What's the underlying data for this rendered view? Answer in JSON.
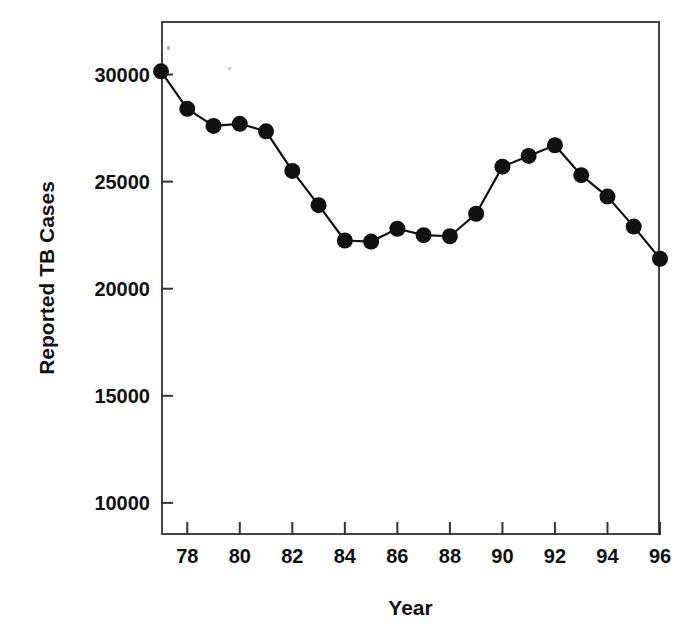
{
  "chart_data": {
    "type": "line",
    "title": "",
    "xlabel": "Year",
    "ylabel": "Reported TB Cases",
    "xlim": [
      77,
      96
    ],
    "ylim": [
      8500,
      32500
    ],
    "grid": false,
    "legend": "none",
    "marker": "filled-circle",
    "line_color": "#111111",
    "marker_color": "#111111",
    "x": [
      77,
      78,
      79,
      80,
      81,
      82,
      83,
      84,
      85,
      86,
      87,
      88,
      89,
      90,
      91,
      92,
      93,
      94,
      95,
      96
    ],
    "xtick_labels": [
      "78",
      "80",
      "82",
      "84",
      "86",
      "88",
      "90",
      "92",
      "94",
      "96"
    ],
    "xticks": [
      78,
      80,
      82,
      84,
      86,
      88,
      90,
      92,
      94,
      96
    ],
    "yticks": [
      10000,
      15000,
      20000,
      25000,
      30000
    ],
    "ytick_labels": [
      "10000",
      "15000",
      "20000",
      "25000",
      "30000"
    ],
    "values": [
      30150,
      28400,
      27600,
      27700,
      27350,
      25500,
      23900,
      22250,
      22200,
      22800,
      22500,
      22450,
      23500,
      25700,
      26200,
      26700,
      25300,
      24300,
      22900,
      21400
    ],
    "series": [
      {
        "name": "Reported TB Cases",
        "values": [
          30150,
          28400,
          27600,
          27700,
          27350,
          25500,
          23900,
          22250,
          22200,
          22800,
          22500,
          22450,
          23500,
          25700,
          26200,
          26700,
          25300,
          24300,
          22900,
          21400
        ]
      }
    ]
  },
  "axes": {
    "y_title": "Reported TB Cases",
    "x_title": "Year"
  }
}
